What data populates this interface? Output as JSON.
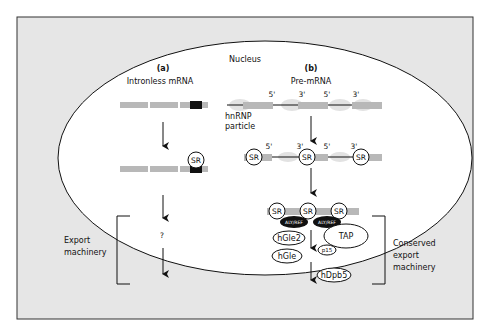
{
  "diagram": {
    "title": "Nucleus",
    "panel_a": {
      "letter": "(a)",
      "title": "Intronless mRNA",
      "sr_label": "SR",
      "question": "?"
    },
    "panel_b": {
      "letter": "(b)",
      "title": "Pre-mRNA",
      "hnrnp_line1": "hnRNP",
      "hnrnp_line2": "particle",
      "site_labels": [
        "5'",
        "3'",
        "5'",
        "3'"
      ],
      "sr_label": "SR",
      "aly_ref": "ALY/REF",
      "tap": "TAP",
      "hgle2": "hGle2",
      "hgle": "hGle",
      "p15": "p15",
      "hdpb5": "hDpb5"
    },
    "left_bracket_label": [
      "Export",
      "machinery"
    ],
    "right_bracket_label": [
      "Conserved",
      "export",
      "machinery"
    ],
    "colors": {
      "background": "#e6e6e6",
      "nucleus": "#ffffff",
      "exon": "#b8b8b8",
      "hnrnp": "#d8d8d8",
      "dark": "#111111"
    }
  }
}
